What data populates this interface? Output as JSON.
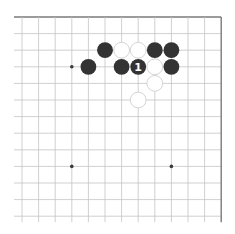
{
  "board": {
    "view": "top-right corner, partial board",
    "origin_x": 22,
    "origin_y": 17,
    "spacing": 16.6,
    "columns": 13,
    "rows": 13,
    "extend_left": 8,
    "extend_bottom": 6,
    "border_top": true,
    "border_right": true,
    "colors": {
      "grid": "#c4c4c4",
      "border": "#7a7a7a",
      "black_stone": "#333333",
      "white_stone": "#ffffff",
      "white_stone_outline": "#cfcfcf",
      "label": "#ffffff"
    },
    "star_points": [
      {
        "col": 3,
        "row": 3
      },
      {
        "col": 3,
        "row": 9
      },
      {
        "col": 9,
        "row": 9
      }
    ],
    "stones": [
      {
        "col": 5,
        "row": 2,
        "color": "black"
      },
      {
        "col": 6,
        "row": 2,
        "color": "white"
      },
      {
        "col": 7,
        "row": 2,
        "color": "white"
      },
      {
        "col": 8,
        "row": 2,
        "color": "black"
      },
      {
        "col": 9,
        "row": 2,
        "color": "black"
      },
      {
        "col": 4,
        "row": 3,
        "color": "black"
      },
      {
        "col": 6,
        "row": 3,
        "color": "black"
      },
      {
        "col": 7,
        "row": 3,
        "color": "black",
        "label": "1"
      },
      {
        "col": 8,
        "row": 3,
        "color": "white"
      },
      {
        "col": 9,
        "row": 3,
        "color": "black"
      },
      {
        "col": 8,
        "row": 4,
        "color": "white"
      },
      {
        "col": 7,
        "row": 5,
        "color": "white"
      }
    ]
  }
}
